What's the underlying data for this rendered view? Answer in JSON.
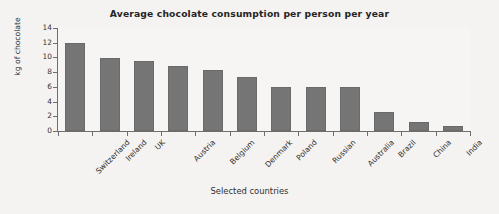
{
  "chart_data": {
    "type": "bar",
    "title": "Average chocolate consumption per person per year",
    "xlabel": "Selected countries",
    "ylabel": "kg of chocolate",
    "categories": [
      "Switzerland",
      "Ireland",
      "UK",
      "Austria",
      "Belgium",
      "Denmark",
      "Poland",
      "Russian",
      "Australia",
      "Brazil",
      "China",
      "India"
    ],
    "values": [
      11.9,
      9.9,
      9.5,
      8.8,
      8.3,
      7.4,
      6.0,
      6.0,
      6.0,
      2.6,
      1.2,
      0.7
    ],
    "ylim": [
      0,
      14
    ],
    "yticks": [
      0,
      2,
      4,
      6,
      8,
      10,
      12,
      14
    ],
    "ytick_labels": [
      "0",
      "2",
      "4",
      "6",
      "8",
      "10",
      "12",
      "14"
    ],
    "grid": false,
    "legend": null,
    "bar_color": "#757575",
    "background_color": "#f4f3f1",
    "axis_color": "#6e6e6e",
    "text_color": "#2f2f2f"
  }
}
